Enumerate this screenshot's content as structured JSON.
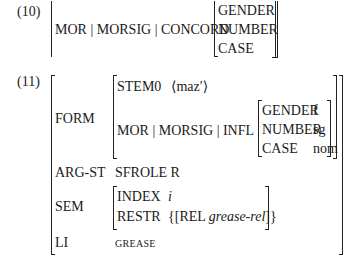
{
  "ex10": {
    "number": "(10)",
    "path": "MOR | MORSIG | CONCORD",
    "features": [
      "GENDER",
      "NUMBER",
      "CASE"
    ]
  },
  "ex11": {
    "number": "(11)",
    "form": {
      "label": "FORM",
      "stem_label": "STEM0",
      "stem_value": "⟨maz′⟩",
      "infl_path": "MOR | MORSIG | INFL",
      "infl": [
        {
          "attr": "GENDER",
          "value": "f"
        },
        {
          "attr": "NUMBER",
          "value": "sg"
        },
        {
          "attr": "CASE",
          "value": "nom"
        }
      ]
    },
    "argst": {
      "label": "ARG-ST",
      "value": "SFROLE R"
    },
    "sem": {
      "label": "SEM",
      "index_label": "INDEX",
      "index_value": "i",
      "restr_label": "RESTR",
      "restr_open": "{[REL ",
      "restr_rel": "grease-rel",
      "restr_close": "]}"
    },
    "li": {
      "label": "LI",
      "value": "GREASE"
    }
  }
}
